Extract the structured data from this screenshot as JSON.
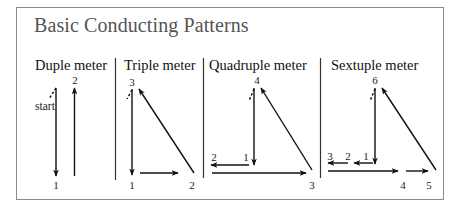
{
  "title": "Basic Conducting Patterns",
  "colors": {
    "frame": "#8a8a8a",
    "title": "#555555",
    "lines": "#111111"
  },
  "patterns": [
    {
      "id": "duple",
      "label": "Duple meter",
      "label_x": 35,
      "beats": [
        {
          "n": "1",
          "x": 56,
          "y": 187
        },
        {
          "n": "2",
          "x": 75,
          "y": 83
        }
      ],
      "start_label": "start"
    },
    {
      "id": "triple",
      "label": "Triple meter",
      "label_x": 124,
      "beats": [
        {
          "n": "1",
          "x": 132,
          "y": 187
        },
        {
          "n": "2",
          "x": 192,
          "y": 187
        },
        {
          "n": "3",
          "x": 132,
          "y": 86
        }
      ]
    },
    {
      "id": "quadruple",
      "label": "Quadruple meter",
      "label_x": 209,
      "beats": [
        {
          "n": "1",
          "x": 246,
          "y": 161
        },
        {
          "n": "2",
          "x": 214,
          "y": 161
        },
        {
          "n": "3",
          "x": 312,
          "y": 189
        },
        {
          "n": "4",
          "x": 257,
          "y": 83
        }
      ]
    },
    {
      "id": "sextuple",
      "label": "Sextuple meter",
      "label_x": 331,
      "beats": [
        {
          "n": "1",
          "x": 366,
          "y": 160
        },
        {
          "n": "2",
          "x": 348,
          "y": 160
        },
        {
          "n": "3",
          "x": 330,
          "y": 160
        },
        {
          "n": "4",
          "x": 403,
          "y": 187
        },
        {
          "n": "5",
          "x": 429,
          "y": 187
        },
        {
          "n": "6",
          "x": 375,
          "y": 83
        }
      ]
    }
  ]
}
